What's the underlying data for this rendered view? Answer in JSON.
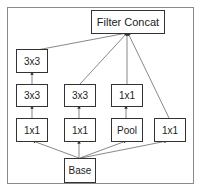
{
  "diagram": {
    "nodes": {
      "concat": {
        "label": "Filter Concat"
      },
      "base": {
        "label": "Base"
      },
      "c1_top": {
        "label": "3x3"
      },
      "c1_mid": {
        "label": "3x3"
      },
      "c1_bot": {
        "label": "1x1"
      },
      "c2_mid": {
        "label": "3x3"
      },
      "c2_bot": {
        "label": "1x1"
      },
      "c3_mid": {
        "label": "1x1"
      },
      "c3_bot": {
        "label": "Pool"
      },
      "c4_bot": {
        "label": "1x1"
      }
    },
    "edges": [
      [
        "base",
        "c1_bot"
      ],
      [
        "base",
        "c2_bot"
      ],
      [
        "base",
        "c3_bot"
      ],
      [
        "base",
        "c4_bot"
      ],
      [
        "c1_bot",
        "c1_mid"
      ],
      [
        "c1_mid",
        "c1_top"
      ],
      [
        "c2_bot",
        "c2_mid"
      ],
      [
        "c3_bot",
        "c3_mid"
      ],
      [
        "c1_top",
        "concat"
      ],
      [
        "c2_mid",
        "concat"
      ],
      [
        "c3_mid",
        "concat"
      ],
      [
        "c4_bot",
        "concat"
      ]
    ]
  }
}
